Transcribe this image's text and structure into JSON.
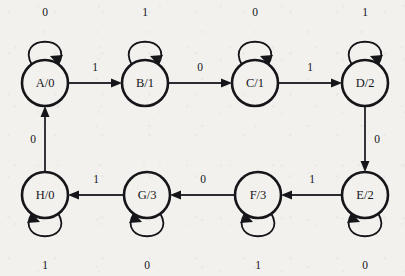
{
  "diagram": {
    "type": "moore-state-machine",
    "colors": {
      "background": "#f2f1ee",
      "stroke": "#16161a",
      "edge": "#2b2b31"
    },
    "states": [
      {
        "id": "A",
        "label": "A/0",
        "cx": 45,
        "cy": 83,
        "r": 23,
        "loop": "above",
        "loop_label": "0"
      },
      {
        "id": "B",
        "label": "B/1",
        "cx": 145,
        "cy": 83,
        "r": 23,
        "loop": "above",
        "loop_label": "1"
      },
      {
        "id": "C",
        "label": "C/1",
        "cx": 255,
        "cy": 83,
        "r": 23,
        "loop": "above",
        "loop_label": "0"
      },
      {
        "id": "D",
        "label": "D/2",
        "cx": 365,
        "cy": 83,
        "r": 23,
        "loop": "above",
        "loop_label": "1"
      },
      {
        "id": "E",
        "label": "E/2",
        "cx": 365,
        "cy": 195,
        "r": 23,
        "loop": "below",
        "loop_label": "0"
      },
      {
        "id": "F",
        "label": "F/3",
        "cx": 258,
        "cy": 195,
        "r": 23,
        "loop": "below",
        "loop_label": "1"
      },
      {
        "id": "G",
        "label": "G/3",
        "cx": 147,
        "cy": 195,
        "r": 23,
        "loop": "below",
        "loop_label": "0"
      },
      {
        "id": "H",
        "label": "H/0",
        "cx": 45,
        "cy": 195,
        "r": 23,
        "loop": "below",
        "loop_label": "1"
      }
    ],
    "transitions": [
      {
        "from": "A",
        "to": "B",
        "label": "1",
        "lx": 95,
        "ly": 68
      },
      {
        "from": "B",
        "to": "C",
        "label": "0",
        "lx": 200,
        "ly": 68
      },
      {
        "from": "C",
        "to": "D",
        "label": "1",
        "lx": 310,
        "ly": 68
      },
      {
        "from": "D",
        "to": "E",
        "label": "0",
        "lx": 377,
        "ly": 140
      },
      {
        "from": "E",
        "to": "F",
        "label": "1",
        "lx": 312,
        "ly": 180
      },
      {
        "from": "F",
        "to": "G",
        "label": "0",
        "lx": 203,
        "ly": 180
      },
      {
        "from": "G",
        "to": "H",
        "label": "1",
        "lx": 96,
        "ly": 180
      },
      {
        "from": "H",
        "to": "A",
        "label": "0",
        "lx": 33,
        "ly": 140
      }
    ],
    "self_loop_labels": [
      {
        "state": "A",
        "label": "0",
        "lx": 45,
        "ly": 13
      },
      {
        "state": "B",
        "label": "1",
        "lx": 145,
        "ly": 13
      },
      {
        "state": "C",
        "label": "0",
        "lx": 255,
        "ly": 13
      },
      {
        "state": "D",
        "label": "1",
        "lx": 365,
        "ly": 13
      },
      {
        "state": "E",
        "label": "0",
        "lx": 365,
        "ly": 266
      },
      {
        "state": "F",
        "label": "1",
        "lx": 258,
        "ly": 266
      },
      {
        "state": "G",
        "label": "0",
        "lx": 147,
        "ly": 266
      },
      {
        "state": "H",
        "label": "1",
        "lx": 45,
        "ly": 266
      }
    ]
  }
}
